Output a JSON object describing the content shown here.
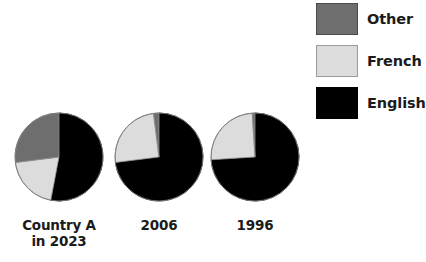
{
  "figure": {
    "background": "#ffffff",
    "width": 424,
    "height": 262
  },
  "legend": {
    "position": "top-right",
    "items": [
      {
        "label": "Other",
        "color": "#6e6e6e",
        "border": "#4a4a4a"
      },
      {
        "label": "French",
        "color": "#dcdcdc",
        "border": "#9a9a9a"
      },
      {
        "label": "English",
        "color": "#000000",
        "border": "#000000"
      }
    ]
  },
  "pies": [
    {
      "label": "Country A\nin 2023",
      "cx": 59,
      "cy": 157,
      "r": 44,
      "slices": [
        {
          "name": "English",
          "value": 53,
          "color": "#000000"
        },
        {
          "name": "French",
          "value": 20,
          "color": "#dcdcdc"
        },
        {
          "name": "Other",
          "value": 27,
          "color": "#6e6e6e"
        }
      ]
    },
    {
      "label": "2006",
      "cx": 159,
      "cy": 157,
      "r": 44,
      "slices": [
        {
          "name": "English",
          "value": 73,
          "color": "#000000"
        },
        {
          "name": "French",
          "value": 25,
          "color": "#dcdcdc"
        },
        {
          "name": "Other",
          "value": 2,
          "color": "#6e6e6e"
        }
      ]
    },
    {
      "label": "1996",
      "cx": 255,
      "cy": 157,
      "r": 44,
      "slices": [
        {
          "name": "English",
          "value": 74,
          "color": "#000000"
        },
        {
          "name": "French",
          "value": 25,
          "color": "#dcdcdc"
        },
        {
          "name": "Other",
          "value": 1,
          "color": "#6e6e6e"
        }
      ]
    }
  ],
  "chart_data": {
    "type": "pie",
    "title": "",
    "xlabel": "",
    "ylabel": "",
    "grid": false,
    "legend_position": "top-right",
    "legend_entries": [
      "Other",
      "French",
      "English"
    ],
    "categories": [
      "English",
      "French",
      "Other"
    ],
    "units": "percent",
    "start_angle_deg": 0,
    "direction": "clockwise",
    "charts": [
      {
        "name": "Country A in 2023",
        "label": "Country A\nin 2023",
        "values": [
          53,
          20,
          27
        ]
      },
      {
        "name": "2006",
        "label": "2006",
        "values": [
          73,
          25,
          2
        ]
      },
      {
        "name": "1996",
        "label": "1996",
        "values": [
          74,
          25,
          1
        ]
      }
    ],
    "series": [
      {
        "name": "English",
        "values": [
          53,
          73,
          74
        ]
      },
      {
        "name": "French",
        "values": [
          20,
          25,
          25
        ]
      },
      {
        "name": "Other",
        "values": [
          27,
          2,
          1
        ]
      }
    ],
    "colors": {
      "English": "#000000",
      "French": "#dcdcdc",
      "Other": "#6e6e6e"
    }
  }
}
